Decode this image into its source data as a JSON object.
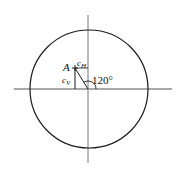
{
  "diagram": {
    "type": "unit-circle-angle",
    "labels": {
      "point": "A",
      "horizontal_component": "c",
      "horizontal_subscript": "H",
      "vertical_component": "c",
      "vertical_subscript": "V",
      "angle": "120°"
    },
    "angle_degrees": 120,
    "colors": {
      "stroke": "#1a1a1a",
      "axis": "#555555",
      "background": "#ffffff"
    }
  }
}
